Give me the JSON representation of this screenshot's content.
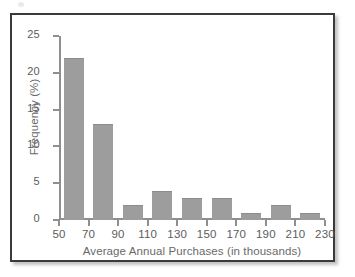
{
  "figure": {
    "background_color": "#ffffff",
    "frame_color": "#3a3a3a"
  },
  "chart_data": {
    "type": "bar",
    "title": "",
    "subtitle": "",
    "xlabel": "Average Annual Purchases (in thousands)",
    "ylabel": "Frequency (%)",
    "bin_edges": [
      50,
      70,
      90,
      110,
      130,
      150,
      170,
      190,
      210,
      230
    ],
    "categories": [
      "50-70",
      "70-90",
      "90-110",
      "110-130",
      "130-150",
      "150-170",
      "170-190",
      "190-210",
      "210-230"
    ],
    "values": [
      22,
      13,
      2,
      4,
      3,
      3,
      1,
      2,
      1
    ],
    "xtick_labels": [
      "50",
      "70",
      "90",
      "110",
      "130",
      "150",
      "170",
      "190",
      "210",
      "230"
    ],
    "ytick_labels": [
      "0",
      "5",
      "10",
      "15",
      "20",
      "25"
    ],
    "ytick_values": [
      0,
      5,
      10,
      15,
      20,
      25
    ],
    "xlim": [
      50,
      230
    ],
    "ylim": [
      0,
      25
    ],
    "grid": false,
    "legend": null,
    "bar_color": "#9d9d9d",
    "axis_color": "#8f8f8f",
    "annotations": []
  }
}
